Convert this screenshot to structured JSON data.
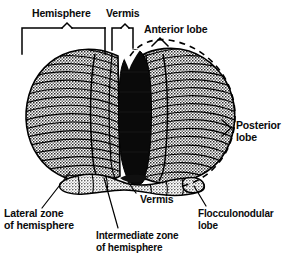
{
  "figure": {
    "kind": "anatomical-line-diagram",
    "background_color": "#ffffff",
    "ink_color": "#000000",
    "fill_tone": "#b9b9b9",
    "vermis_color": "#0a0a0a"
  },
  "labels": {
    "hemisphere": "Hemisphere",
    "vermis_top": "Vermis",
    "anterior_lobe": "Anterior lobe",
    "posterior_lobe_line1": "Posterior",
    "posterior_lobe_line2": "lobe",
    "vermis_bottom": "Vermis",
    "lateral_zone_line1": "Lateral zone",
    "lateral_zone_line2": "of hemisphere",
    "intermediate_zone_line1": "Intermediate zone",
    "intermediate_zone_line2": "of hemisphere",
    "flocculonodular_line1": "Flocculonodular",
    "flocculonodular_line2": "lobe"
  },
  "annotations": {
    "hemisphere_bracket": "square-bracket-with-center-caret",
    "vermis_bracket": "narrow-square-bracket",
    "anterior_lobe_pointer": "caret-pointer",
    "posterior_lobe_pointer": "angle-bracket-pointer",
    "lobe_outline": "dashed-ellipse",
    "leader_lines": "diagonal-leader-lines"
  },
  "structures": [
    {
      "name": "left-cerebellar-hemisphere",
      "tone": "stippled-gray"
    },
    {
      "name": "right-cerebellar-hemisphere",
      "tone": "stippled-gray"
    },
    {
      "name": "vermis",
      "tone": "solid-black"
    },
    {
      "name": "flocculonodular-lobe",
      "tone": "stippled-gray"
    },
    {
      "name": "folia",
      "tone": "fine-horizontal-lines"
    }
  ]
}
